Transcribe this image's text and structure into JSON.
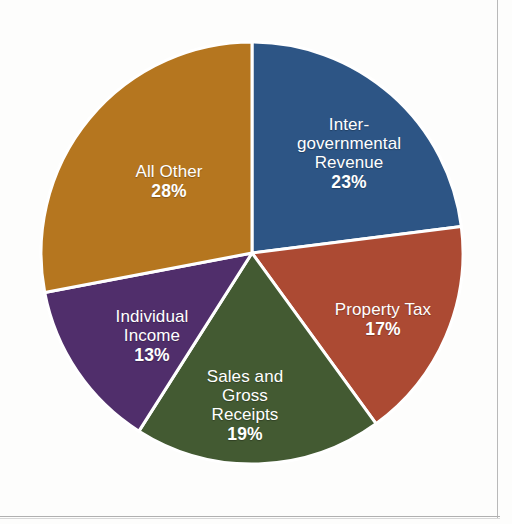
{
  "chart_data": {
    "type": "pie",
    "title": "",
    "categories": [
      "Inter-governmental Revenue",
      "Property Tax",
      "Sales and Gross Receipts",
      "Individual Income",
      "All Other"
    ],
    "values": [
      23,
      17,
      19,
      13,
      28
    ],
    "unit": "%",
    "total": 100,
    "legend": "none",
    "grid": false,
    "start_angle_deg": 0,
    "direction": "clockwise",
    "slice_separator_color": "#ffffff",
    "slices": [
      {
        "name": "intergovernmental-revenue",
        "label": "Inter-\ngovernmental\nRevenue",
        "value": 23,
        "percent_text": "23%",
        "color": "#2d5585"
      },
      {
        "name": "property-tax",
        "label": "Property Tax",
        "value": 17,
        "percent_text": "17%",
        "color": "#ac4a33"
      },
      {
        "name": "sales-and-gross-receipts",
        "label": "Sales and\nGross\nReceipts",
        "value": 19,
        "percent_text": "19%",
        "color": "#435a32"
      },
      {
        "name": "individual-income",
        "label": "Individual\nIncome",
        "value": 13,
        "percent_text": "13%",
        "color": "#502e6b"
      },
      {
        "name": "all-other",
        "label": "All Other",
        "value": 28,
        "percent_text": "28%",
        "color": "#b5761f"
      }
    ]
  }
}
